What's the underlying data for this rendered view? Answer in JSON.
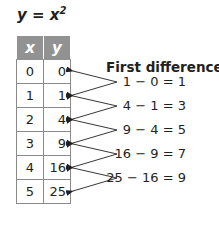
{
  "title": {
    "lhs": "y",
    "eq": " = ",
    "base": "x",
    "exp": "2"
  },
  "table": {
    "headers": [
      "x",
      "y"
    ],
    "rows": [
      {
        "x": "0",
        "y": "0"
      },
      {
        "x": "1",
        "y": "1"
      },
      {
        "x": "2",
        "y": "4"
      },
      {
        "x": "3",
        "y": "9"
      },
      {
        "x": "4",
        "y": "16"
      },
      {
        "x": "5",
        "y": "25"
      }
    ]
  },
  "first_differences": {
    "title": "First differences",
    "items": [
      "1 − 0 = 1",
      "4 − 1 = 3",
      "9 − 4 = 5",
      "16 − 9 = 7",
      "25 − 16 = 9"
    ]
  },
  "colors": {
    "header_bg": "#929292",
    "text": "#231f20",
    "border": "#8a8a8a"
  }
}
